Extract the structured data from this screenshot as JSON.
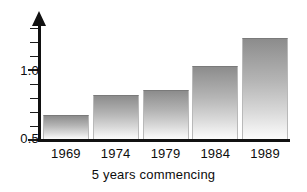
{
  "chart_data": {
    "type": "bar",
    "title": "",
    "xlabel": "5 years commencing",
    "ylabel": "",
    "categories": [
      "1969",
      "1974",
      "1979",
      "1984",
      "1989"
    ],
    "values": [
      0.68,
      0.82,
      0.86,
      1.03,
      1.23
    ],
    "ylim": [
      0.5,
      1.35
    ],
    "ytick_labels": [
      "0.5",
      "1.0"
    ],
    "ytick_values": [
      0.5,
      1.0
    ],
    "yticks_minor": [
      0.6,
      0.7,
      0.8,
      0.9,
      1.1,
      1.2,
      1.3
    ],
    "grid": false,
    "legend": null,
    "axis_arrow": true,
    "bar_style": "vertical-gradient-gray"
  },
  "axis": {
    "y_labels": [
      {
        "text": "1.0",
        "value": 1.0
      },
      {
        "text": "0.5",
        "value": 0.5
      }
    ],
    "x_title": "5 years commencing"
  },
  "colors": {
    "axis": "#111111",
    "text": "#0d0d0d",
    "bar_top": "#8c8c8c",
    "bar_bottom": "#fbfbfb",
    "background": "#ffffff"
  }
}
